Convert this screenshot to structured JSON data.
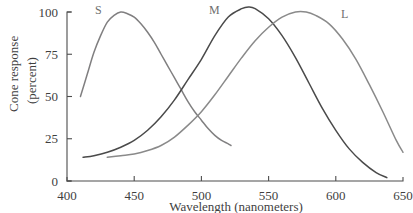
{
  "chart_data": {
    "type": "line",
    "title": "",
    "subtitle": "",
    "xlabel": "Wavelength (nanometers)",
    "ylabel": "Cone response\n(percent)",
    "ylabel_line1": "Cone response",
    "ylabel_line2": "(percent)",
    "xlim": [
      400,
      650
    ],
    "ylim": [
      0,
      100
    ],
    "grid": false,
    "legend_position": "inline-labels",
    "x_ticks": [
      400,
      450,
      500,
      550,
      600,
      650
    ],
    "x_tick_labels": [
      "400",
      "450",
      "500",
      "550",
      "600",
      "650"
    ],
    "y_ticks": [
      0,
      25,
      50,
      75,
      100
    ],
    "y_tick_labels": [
      "0",
      "25",
      "50",
      "75",
      "100"
    ],
    "series": [
      {
        "name": "S",
        "label": "S",
        "color": "#807f80",
        "peak_x": 440,
        "peak_y": 100,
        "x": [
          410,
          415,
          420,
          425,
          430,
          435,
          440,
          445,
          450,
          455,
          460,
          465,
          470,
          475,
          480,
          485,
          490,
          495,
          500,
          505,
          510,
          515,
          520,
          522
        ],
        "y": [
          50,
          63,
          76,
          86,
          94,
          98,
          100,
          99,
          97,
          93,
          88,
          82,
          75,
          68,
          61,
          54,
          47,
          41,
          36,
          31,
          27,
          24,
          22,
          21
        ]
      },
      {
        "name": "M",
        "label": "M",
        "color": "#4a4a4a",
        "peak_x": 535,
        "peak_y": 103,
        "x": [
          412,
          420,
          430,
          440,
          450,
          460,
          470,
          480,
          490,
          500,
          510,
          520,
          530,
          535,
          540,
          550,
          560,
          570,
          580,
          590,
          600,
          610,
          620,
          630,
          638
        ],
        "y": [
          14,
          15,
          17,
          20,
          24,
          30,
          38,
          48,
          60,
          72,
          86,
          97,
          102,
          103,
          102,
          96,
          86,
          73,
          58,
          43,
          30,
          19,
          11,
          5,
          2
        ]
      },
      {
        "name": "L",
        "label": "L",
        "color": "#8a8a8a",
        "peak_x": 578,
        "peak_y": 100,
        "x": [
          430,
          440,
          450,
          460,
          470,
          480,
          490,
          500,
          510,
          520,
          530,
          540,
          550,
          560,
          570,
          578,
          585,
          595,
          605,
          615,
          625,
          635,
          645,
          650
        ],
        "y": [
          14,
          15,
          16,
          18,
          21,
          26,
          33,
          41,
          51,
          62,
          73,
          83,
          91,
          97,
          100,
          100,
          98,
          93,
          84,
          72,
          57,
          41,
          24,
          17
        ]
      }
    ],
    "series_label_positions": [
      {
        "name": "S",
        "x": 95,
        "y": 14
      },
      {
        "name": "M",
        "x": 209,
        "y": 14
      },
      {
        "name": "L",
        "x": 341,
        "y": 18
      }
    ]
  }
}
